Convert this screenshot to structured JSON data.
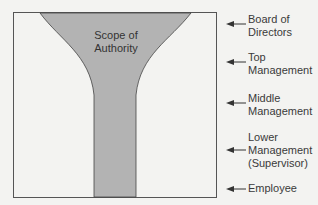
{
  "diagram": {
    "shape_label": "Scope of Authority",
    "shape_label_lines": [
      "Scope of",
      "Authority"
    ],
    "levels": [
      {
        "lines": [
          "Board of",
          "Directors"
        ]
      },
      {
        "lines": [
          "Top",
          "Management"
        ]
      },
      {
        "lines": [
          "Middle",
          "Management"
        ]
      },
      {
        "lines": [
          "Lower",
          "Management",
          "(Supervisor)"
        ]
      },
      {
        "lines": [
          "Employee"
        ]
      }
    ],
    "colors": {
      "fill": "#b3b3b3",
      "border": "#555555",
      "background": "#f3f3f1"
    }
  }
}
